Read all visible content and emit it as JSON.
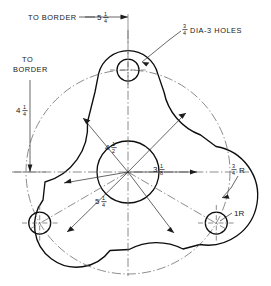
{
  "drawing": {
    "title": "Three-lobed bracket plate — dimensioned engineering drawing",
    "type": "mechanical-orthographic-view",
    "units": "inches",
    "line_color": "#0d0d0d",
    "centerline_color": "#5f5f5f",
    "background": "#ffffff"
  },
  "annotations": {
    "to_border_top": {
      "label": "TO BORDER",
      "dimension_whole": "5",
      "dimension_num": "1",
      "dimension_den": "4",
      "dimension_text": "5 1/4",
      "orientation": "horizontal"
    },
    "to_border_left": {
      "label_line1": "TO",
      "label_line2": "BORDER",
      "dimension_whole": "4",
      "dimension_num": "1",
      "dimension_den": "4",
      "dimension_text": "4 1/4",
      "orientation": "vertical"
    },
    "holes_note": {
      "num": "3",
      "den": "4",
      "text": "DIA-3 HOLES",
      "full_text": "3/4 DIA-3 HOLES"
    },
    "bolt_circle": {
      "whole": "4",
      "num": "1",
      "den": "2",
      "text": "4 1/2"
    },
    "bore_radius": {
      "whole": "3",
      "num": "1",
      "den": "8",
      "text": "3 1/8"
    },
    "outer_radius": {
      "whole": "5",
      "num": "1",
      "den": "4",
      "text": "5 1/4"
    },
    "fillet_radius": {
      "num": "3",
      "den": "4",
      "suffix": "R",
      "text": "3/4 R"
    },
    "lobe_radius": {
      "text": "1R"
    }
  },
  "geometry": {
    "center_x": 128,
    "center_y": 172,
    "bore_radius_px": 31,
    "hole_radius_px": 11,
    "bolt_circle_radius_px": 102,
    "hole_angles_deg": [
      270,
      30,
      150
    ],
    "lobe_count": 3
  }
}
